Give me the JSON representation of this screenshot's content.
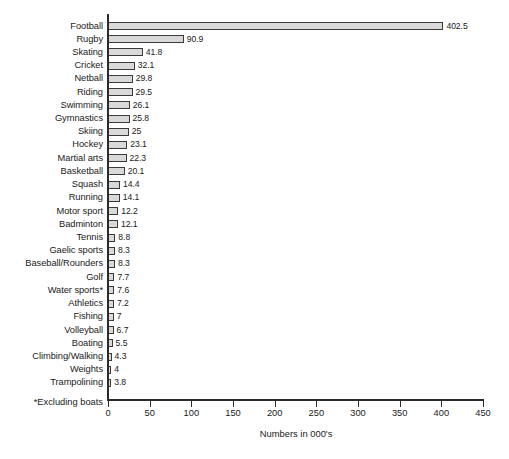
{
  "chart_data": {
    "type": "bar",
    "orientation": "horizontal",
    "title": "",
    "xlabel": "Numbers in 000's",
    "ylabel": "",
    "xlim": [
      0,
      450
    ],
    "xticks": [
      0,
      50,
      100,
      150,
      200,
      250,
      300,
      350,
      400,
      450
    ],
    "grid": false,
    "legend": null,
    "footnote": "*Excluding boats",
    "bar_fill_color": "#d9d9d9",
    "bar_border_color": "#3a3a3a",
    "axis_color": "#2b2b2b",
    "categories": [
      "Football",
      "Rugby",
      "Skating",
      "Cricket",
      "Netball",
      "Riding",
      "Swimming",
      "Gymnastics",
      "Skiing",
      "Hockey",
      "Martial arts",
      "Basketball",
      "Squash",
      "Running",
      "Motor sport",
      "Badminton",
      "Tennis",
      "Gaelic sports",
      "Baseball/Rounders",
      "Golf",
      "Water sports*",
      "Athletics",
      "Fishing",
      "Volleyball",
      "Boating",
      "Climbing/Walking",
      "Weights",
      "Trampolining"
    ],
    "values": [
      402.5,
      90.9,
      41.8,
      32.1,
      29.8,
      29.5,
      26.1,
      25.8,
      25,
      23.1,
      22.3,
      20.1,
      14.4,
      14.1,
      12.2,
      12.1,
      8.8,
      8.3,
      8.3,
      7.7,
      7.6,
      7.2,
      7,
      6.7,
      5.5,
      4.3,
      4,
      3.8
    ],
    "value_labels": [
      "402.5",
      "90.9",
      "41.8",
      "32.1",
      "29.8",
      "29.5",
      "26.1",
      "25.8",
      "25",
      "23.1",
      "22.3",
      "20.1",
      "14.4",
      "14.1",
      "12.2",
      "12.1",
      "8.8",
      "8.3",
      "8.3",
      "7.7",
      "7.6",
      "7.2",
      "7",
      "6.7",
      "5.5",
      "4.3",
      "4",
      "3.8"
    ],
    "xtick_labels": [
      "0",
      "50",
      "100",
      "150",
      "200",
      "250",
      "300",
      "350",
      "400",
      "450"
    ]
  }
}
